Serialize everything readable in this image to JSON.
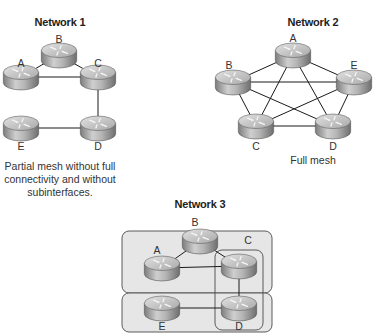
{
  "networks": [
    {
      "id": "network-1",
      "title": "Network 1",
      "title_pos": [
        60,
        16
      ],
      "caption": [
        "Partial mesh without full",
        "connectivity and without",
        "subinterfaces."
      ],
      "caption_pos": [
        60,
        160
      ],
      "nodes": [
        {
          "name": "A",
          "x": 21,
          "y": 77,
          "label_x": 21,
          "label_y": 63
        },
        {
          "name": "B",
          "x": 59,
          "y": 55,
          "label_x": 59,
          "label_y": 39
        },
        {
          "name": "C",
          "x": 98,
          "y": 77,
          "label_x": 98,
          "label_y": 63
        },
        {
          "name": "D",
          "x": 98,
          "y": 128,
          "label_x": 98,
          "label_y": 146
        },
        {
          "name": "E",
          "x": 21,
          "y": 128,
          "label_x": 21,
          "label_y": 146
        }
      ],
      "links": [
        [
          "A",
          "B"
        ],
        [
          "B",
          "C"
        ],
        [
          "A",
          "C"
        ],
        [
          "C",
          "D"
        ],
        [
          "E",
          "D"
        ]
      ]
    },
    {
      "id": "network-2",
      "title": "Network 2",
      "title_pos": [
        313,
        16
      ],
      "caption": [
        "Full mesh"
      ],
      "caption_pos": [
        313,
        154
      ],
      "nodes": [
        {
          "name": "A",
          "x": 293,
          "y": 55,
          "label_x": 293,
          "label_y": 38
        },
        {
          "name": "B",
          "x": 233,
          "y": 82,
          "label_x": 229,
          "label_y": 65
        },
        {
          "name": "C",
          "x": 256,
          "y": 126,
          "label_x": 256,
          "label_y": 146
        },
        {
          "name": "D",
          "x": 333,
          "y": 126,
          "label_x": 333,
          "label_y": 146
        },
        {
          "name": "E",
          "x": 354,
          "y": 82,
          "label_x": 354,
          "label_y": 65
        }
      ],
      "links": [
        [
          "A",
          "B"
        ],
        [
          "A",
          "C"
        ],
        [
          "A",
          "D"
        ],
        [
          "A",
          "E"
        ],
        [
          "B",
          "C"
        ],
        [
          "B",
          "D"
        ],
        [
          "B",
          "E"
        ],
        [
          "C",
          "D"
        ],
        [
          "C",
          "E"
        ],
        [
          "D",
          "E"
        ]
      ]
    },
    {
      "id": "network-3",
      "title": "Network 3",
      "title_pos": [
        200,
        198
      ],
      "caption": [],
      "nodes": [
        {
          "name": "A",
          "x": 162,
          "y": 268,
          "label_x": 157,
          "label_y": 250
        },
        {
          "name": "B",
          "x": 200,
          "y": 241,
          "label_x": 195,
          "label_y": 222
        },
        {
          "name": "C",
          "x": 239,
          "y": 266,
          "label_x": 248,
          "label_y": 240
        },
        {
          "name": "D",
          "x": 239,
          "y": 308,
          "label_x": 239,
          "label_y": 326
        },
        {
          "name": "E",
          "x": 162,
          "y": 308,
          "label_x": 162,
          "label_y": 326
        }
      ],
      "links": [
        [
          "A",
          "B"
        ],
        [
          "B",
          "C"
        ],
        [
          "A",
          "C"
        ],
        [
          "C",
          "D"
        ],
        [
          "E",
          "D"
        ]
      ],
      "regions": [
        {
          "name": "subinterface-region-abc",
          "x": 122,
          "y": 231,
          "w": 150,
          "h": 62,
          "r": 7
        },
        {
          "name": "subinterface-region-ed",
          "x": 122,
          "y": 293,
          "w": 150,
          "h": 39,
          "r": 7
        },
        {
          "name": "subinterface-region-cd",
          "x": 215,
          "y": 250,
          "w": 48,
          "h": 80,
          "r": 7
        }
      ]
    }
  ],
  "colors": {
    "link": "#1a1a1a",
    "region_fill": "#e6e6e6",
    "region_stroke": "#4a4a4a",
    "router_top": "#c9c9c9",
    "router_body": "#9a9a9a"
  }
}
